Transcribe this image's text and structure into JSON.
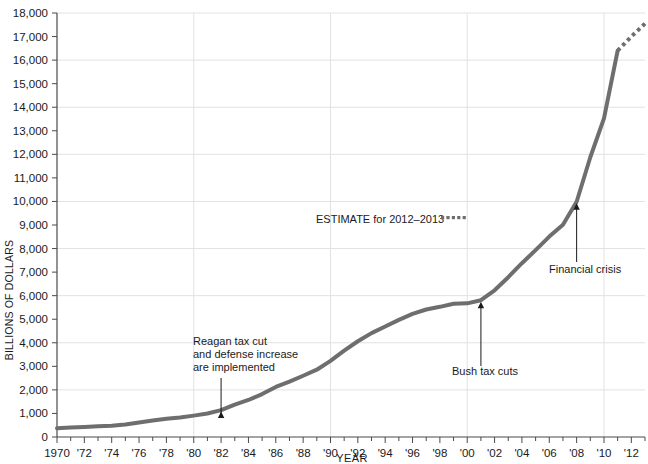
{
  "chart_data": {
    "type": "line",
    "title": "",
    "xlabel": "YEAR",
    "ylabel": "BILLIONS OF DOLLARS",
    "xlim": [
      1970,
      2013
    ],
    "ylim": [
      0,
      18000
    ],
    "grid": true,
    "legend_position": "inline-annotation",
    "y_ticks": [
      "0",
      "1,000",
      "2,000",
      "3,000",
      "4,000",
      "5,000",
      "6,000",
      "7,000",
      "8,000",
      "9,000",
      "10,000",
      "11,000",
      "12,000",
      "13,000",
      "14,000",
      "15,000",
      "16,000",
      "17,000",
      "18,000"
    ],
    "y_tick_values": [
      0,
      1000,
      2000,
      3000,
      4000,
      5000,
      6000,
      7000,
      8000,
      9000,
      10000,
      11000,
      12000,
      13000,
      14000,
      15000,
      16000,
      17000,
      18000
    ],
    "x_ticks": [
      "1970",
      "'72",
      "'74",
      "'76",
      "'78",
      "'80",
      "'82",
      "'84",
      "'86",
      "'88",
      "'90",
      "'92",
      "'94",
      "'96",
      "'98",
      "'00",
      "'02",
      "'04",
      "'06",
      "'08",
      "'10",
      "'12"
    ],
    "x_tick_values": [
      1970,
      1972,
      1974,
      1976,
      1978,
      1980,
      1982,
      1984,
      1986,
      1988,
      1990,
      1992,
      1994,
      1996,
      1998,
      2000,
      2002,
      2004,
      2006,
      2008,
      2010,
      2012
    ],
    "line_color": "#6e6e6e",
    "series": [
      {
        "name": "Actual debt",
        "style": "solid",
        "x": [
          1970,
          1971,
          1972,
          1973,
          1974,
          1975,
          1976,
          1977,
          1978,
          1979,
          1980,
          1981,
          1982,
          1983,
          1984,
          1985,
          1986,
          1987,
          1988,
          1989,
          1990,
          1991,
          1992,
          1993,
          1994,
          1995,
          1996,
          1997,
          1998,
          1999,
          2000,
          2001,
          2002,
          2003,
          2004,
          2005,
          2006,
          2007,
          2008,
          2009,
          2010,
          2011
        ],
        "values": [
          371,
          398,
          427,
          458,
          475,
          533,
          620,
          699,
          772,
          827,
          908,
          998,
          1142,
          1377,
          1572,
          1823,
          2125,
          2350,
          2602,
          2857,
          3233,
          3665,
          4065,
          4411,
          4693,
          4974,
          5225,
          5413,
          5526,
          5656,
          5674,
          5807,
          6228,
          6783,
          7379,
          7933,
          8507,
          9008,
          9986,
          11876,
          13529,
          16400
        ]
      },
      {
        "name": "ESTIMATE for 2012-2013",
        "style": "dotted",
        "x": [
          2011,
          2012,
          2013
        ],
        "values": [
          16400,
          17000,
          17550
        ]
      }
    ],
    "annotations": [
      {
        "id": "reagan",
        "lines": [
          "Reagan tax cut",
          "and defense increase",
          "are implemented"
        ],
        "target_x": 1982,
        "target_y": 1142
      },
      {
        "id": "bush",
        "lines": [
          "Bush tax cuts"
        ],
        "target_x": 2001,
        "target_y": 5807
      },
      {
        "id": "financial-crisis",
        "lines": [
          "Financial crisis"
        ],
        "target_x": 2008,
        "target_y": 9986
      },
      {
        "id": "estimate-legend",
        "lines": [
          "ESTIMATE for 2012–2013"
        ],
        "target_x": null,
        "target_y": null
      }
    ]
  },
  "chart": {
    "ylabel": "BILLIONS OF DOLLARS",
    "xlabel": "YEAR",
    "estimate_legend_label": "ESTIMATE for 2012–2013",
    "annotation_reagan_line1": "Reagan tax cut",
    "annotation_reagan_line2": "and defense increase",
    "annotation_reagan_line3": "are implemented",
    "annotation_bush": "Bush tax cuts",
    "annotation_crisis": "Financial crisis",
    "colors": {
      "line": "#6e6e6e",
      "grid": "#e2e2e2",
      "axis": "#4a4a4a",
      "text": "#1a1a1a"
    }
  }
}
